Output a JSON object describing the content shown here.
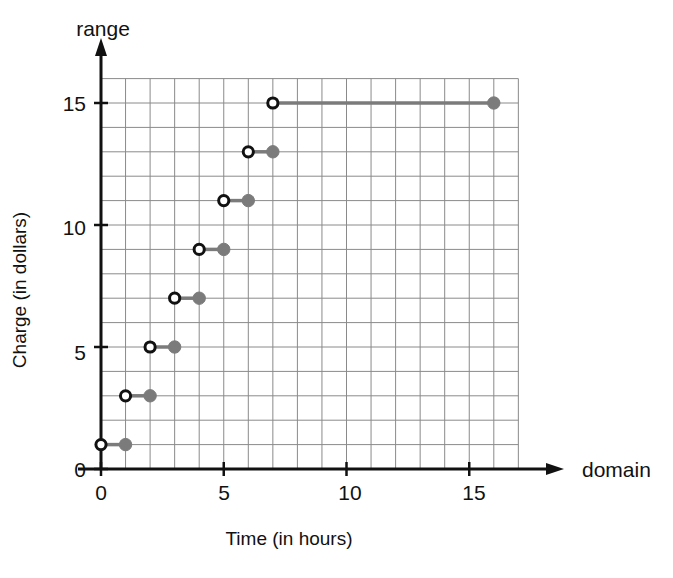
{
  "chart_data": {
    "type": "line",
    "title": "",
    "subtitle": "",
    "xlabel": "Time (in hours)",
    "ylabel": "Charge (in dollars)",
    "x_axis_name": "domain",
    "y_axis_name": "range",
    "xlim": [
      0,
      17
    ],
    "ylim": [
      0,
      16
    ],
    "x_ticks": [
      0,
      5,
      10,
      15
    ],
    "x_tick_labels": [
      "0",
      "5",
      "10",
      "15"
    ],
    "y_ticks": [
      0,
      5,
      10,
      15
    ],
    "y_tick_labels": [
      "0",
      "5",
      "10",
      "15"
    ],
    "grid": true,
    "grid_step_x": 1,
    "grid_step_y": 1,
    "legend": "none",
    "step_style": "left-open-right-closed",
    "series": [
      {
        "name": "Charge",
        "color": "#7b7b7b",
        "segments": [
          {
            "x_start": 0,
            "x_end": 1,
            "y": 1,
            "start_marker": "open-circle",
            "end_marker": "filled-circle"
          },
          {
            "x_start": 1,
            "x_end": 2,
            "y": 3,
            "start_marker": "open-circle",
            "end_marker": "filled-circle"
          },
          {
            "x_start": 2,
            "x_end": 3,
            "y": 5,
            "start_marker": "open-circle",
            "end_marker": "filled-circle"
          },
          {
            "x_start": 3,
            "x_end": 4,
            "y": 7,
            "start_marker": "open-circle",
            "end_marker": "filled-circle"
          },
          {
            "x_start": 4,
            "x_end": 5,
            "y": 9,
            "start_marker": "open-circle",
            "end_marker": "filled-circle"
          },
          {
            "x_start": 5,
            "x_end": 6,
            "y": 11,
            "start_marker": "open-circle",
            "end_marker": "filled-circle"
          },
          {
            "x_start": 6,
            "x_end": 7,
            "y": 13,
            "start_marker": "open-circle",
            "end_marker": "filled-circle"
          },
          {
            "x_start": 7,
            "x_end": 16,
            "y": 15,
            "start_marker": "open-circle",
            "end_marker": "filled-circle"
          }
        ]
      }
    ],
    "colors": {
      "grid": "#8a8a8a",
      "axis": "#111111",
      "marker_fill": "#7b7b7b",
      "marker_open_stroke": "#111111",
      "segment": "#7b7b7b",
      "background": "#ffffff"
    }
  },
  "labels": {
    "range": "range",
    "domain": "domain",
    "x_title": "Time (in hours)",
    "y_title": "Charge (in dollars)",
    "x_tick_0": "0",
    "x_tick_5": "5",
    "x_tick_10": "10",
    "x_tick_15": "15",
    "y_tick_0": "0",
    "y_tick_5": "5",
    "y_tick_10": "10",
    "y_tick_15": "15"
  }
}
